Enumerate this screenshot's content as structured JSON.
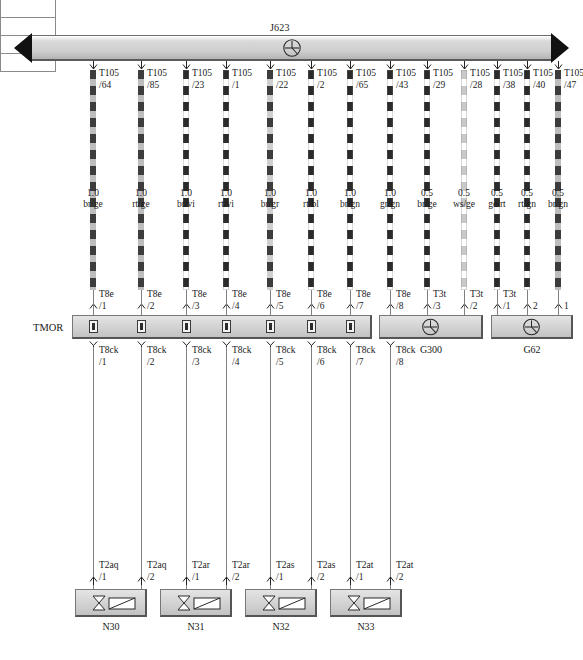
{
  "diagram": {
    "title": "J623",
    "busbar": {
      "label": "J623",
      "symbol": "ground-splice-icon"
    }
  },
  "top_connectors": [
    {
      "name": "T105",
      "pin": "/64"
    },
    {
      "name": "T105",
      "pin": "/85"
    },
    {
      "name": "T105",
      "pin": "/23"
    },
    {
      "name": "T105",
      "pin": "/1"
    },
    {
      "name": "T105",
      "pin": "/22"
    },
    {
      "name": "T105",
      "pin": "/2"
    },
    {
      "name": "T105",
      "pin": "/65"
    },
    {
      "name": "T105",
      "pin": "/43"
    },
    {
      "name": "T105",
      "pin": "/29"
    },
    {
      "name": "T105",
      "pin": "/28"
    },
    {
      "name": "T105",
      "pin": "/38"
    },
    {
      "name": "T105",
      "pin": "/40"
    },
    {
      "name": "T105",
      "pin": "/47"
    }
  ],
  "wires": [
    {
      "gauge": "1.0",
      "color": "br/ge",
      "dark": "#3c3c3c",
      "light": "#bdbdbd"
    },
    {
      "gauge": "1.0",
      "color": "rt/ge",
      "dark": "#3c3c3c",
      "light": "#bdbdbd"
    },
    {
      "gauge": "1.0",
      "color": "br/vi",
      "dark": "#2b2b2b",
      "light": "#ffffff"
    },
    {
      "gauge": "1.0",
      "color": "rt/vi",
      "dark": "#2b2b2b",
      "light": "#ffffff"
    },
    {
      "gauge": "1.0",
      "color": "br/gr",
      "dark": "#3c3c3c",
      "light": "#cfcfcf"
    },
    {
      "gauge": "1.0",
      "color": "rt/bl",
      "dark": "#2b2b2b",
      "light": "#ffffff"
    },
    {
      "gauge": "1.0",
      "color": "br/gn",
      "dark": "#2b2b2b",
      "light": "#ffffff"
    },
    {
      "gauge": "1.0",
      "color": "gr/gn",
      "dark": "#2b2b2b",
      "light": "#ffffff"
    },
    {
      "gauge": "0.5",
      "color": "br/ge",
      "dark": "#2b2b2b",
      "light": "#ffffff"
    },
    {
      "gauge": "0.5",
      "color": "ws/ge",
      "dark": "#c9c9c9",
      "light": "#ffffff"
    },
    {
      "gauge": "0.5",
      "color": "ge/rt",
      "dark": "#2b2b2b",
      "light": "#ffffff"
    },
    {
      "gauge": "0.5",
      "color": "rt/gn",
      "dark": "#2b2b2b",
      "light": "#ffffff"
    },
    {
      "gauge": "0.5",
      "color": "br/gn",
      "dark": "#3c3c3c",
      "light": "#bdbdbd"
    }
  ],
  "lower_connectors": [
    {
      "name": "T8e",
      "pin": "/1"
    },
    {
      "name": "T8e",
      "pin": "/2"
    },
    {
      "name": "T8e",
      "pin": "/3"
    },
    {
      "name": "T8e",
      "pin": "/4"
    },
    {
      "name": "T8e",
      "pin": "/5"
    },
    {
      "name": "T8e",
      "pin": "/6"
    },
    {
      "name": "T8e",
      "pin": "/7"
    },
    {
      "name": "T8e",
      "pin": "/8"
    },
    {
      "name": "T3t",
      "pin": "/3"
    },
    {
      "name": "T3t",
      "pin": "/2"
    },
    {
      "name": "T3t",
      "pin": "/1"
    },
    {
      "name": "",
      "pin": "2"
    },
    {
      "name": "",
      "pin": "1"
    }
  ],
  "tmor": {
    "label": "TMOR",
    "outputs": [
      {
        "name": "T8ck",
        "pin": "/1"
      },
      {
        "name": "T8ck",
        "pin": "/2"
      },
      {
        "name": "T8ck",
        "pin": "/3"
      },
      {
        "name": "T8ck",
        "pin": "/4"
      },
      {
        "name": "T8ck",
        "pin": "/5"
      },
      {
        "name": "T8ck",
        "pin": "/6"
      },
      {
        "name": "T8ck",
        "pin": "/7"
      },
      {
        "name": "T8ck",
        "pin": "/8"
      }
    ]
  },
  "grounds": [
    {
      "label": "G300",
      "symbol": "ground-splice-icon"
    },
    {
      "label": "G62",
      "symbol": "ground-splice-icon"
    }
  ],
  "injectors": [
    {
      "label": "N30",
      "connector": "T2aq",
      "pins": [
        "/1",
        "/2"
      ],
      "symbol": "injector-valve-icon"
    },
    {
      "label": "N31",
      "connector": "T2ar",
      "pins": [
        "/1",
        "/2"
      ],
      "symbol": "injector-valve-icon"
    },
    {
      "label": "N32",
      "connector": "T2as",
      "pins": [
        "/1",
        "/2"
      ],
      "symbol": "injector-valve-icon"
    },
    {
      "label": "N33",
      "connector": "T2at",
      "pins": [
        "/1",
        "/2"
      ],
      "symbol": "injector-valve-icon"
    }
  ],
  "layout": {
    "wire_x": [
      93,
      141,
      186,
      226,
      270,
      311,
      350,
      390,
      427,
      464,
      497,
      527,
      558
    ],
    "injector_x": [
      75,
      160,
      245,
      330
    ]
  }
}
